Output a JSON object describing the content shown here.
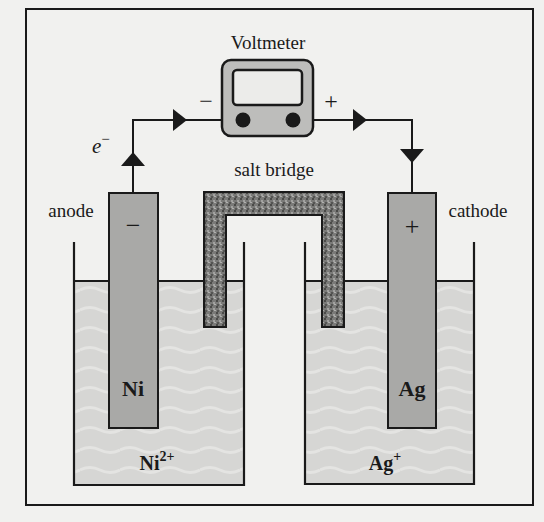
{
  "diagram": {
    "voltmeter": {
      "label": "Voltmeter",
      "neg_terminal": "−",
      "pos_terminal": "+"
    },
    "electron_label": "e",
    "electron_sup": "−",
    "salt_bridge_label": "salt bridge",
    "anode": {
      "label": "anode",
      "sign": "−",
      "electrode": "Ni",
      "ion": "Ni",
      "ion_charge": "2+"
    },
    "cathode": {
      "label": "cathode",
      "sign": "+",
      "electrode": "Ag",
      "ion": "Ag",
      "ion_charge": "+"
    },
    "colors": {
      "background": "#f1f1ef",
      "line": "#1a1a1a",
      "electrode": "#a9a9a7",
      "solution": "#d6d6d4",
      "salt_bridge": "#6e6e6c",
      "voltmeter_body": "#bdbdbb",
      "voltmeter_screen": "#ececea"
    }
  }
}
